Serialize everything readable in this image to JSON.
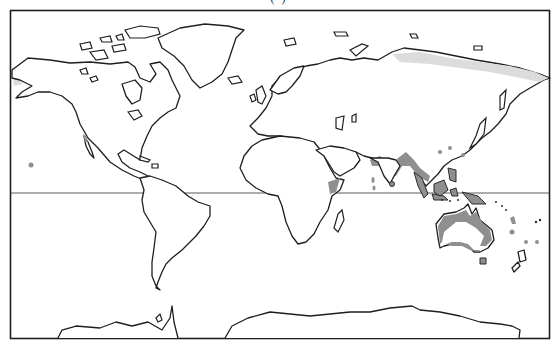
{
  "map": {
    "title_fragment": "(                    )",
    "type": "world outline map",
    "projection": "Mercator-like",
    "equator_line": true,
    "frame": true,
    "legend": null,
    "shading": {
      "dark": {
        "color": "#8f8f8f",
        "regions": [
          "Western India coast",
          "Bay of Bengal / Myanmar coast",
          "Indochina coast",
          "Southeast Asia (Malaysia, Indonesia, Borneo)",
          "Philippines",
          "New Guinea",
          "Northern and southern Australia coast",
          "Tasmania",
          "Horn of Africa (Somalia)",
          "Sri Lanka",
          "Pacific islands (Fiji, Samoa)",
          "Maldives",
          "Baja California / Mexico west coast",
          "Hawaii"
        ]
      },
      "light": {
        "color": "#dcdcdc",
        "regions": [
          "Northern Siberia coast",
          "Western Alaska"
        ]
      }
    },
    "colors": {
      "outline": "#1e1e1e",
      "background": "#ffffff"
    }
  }
}
